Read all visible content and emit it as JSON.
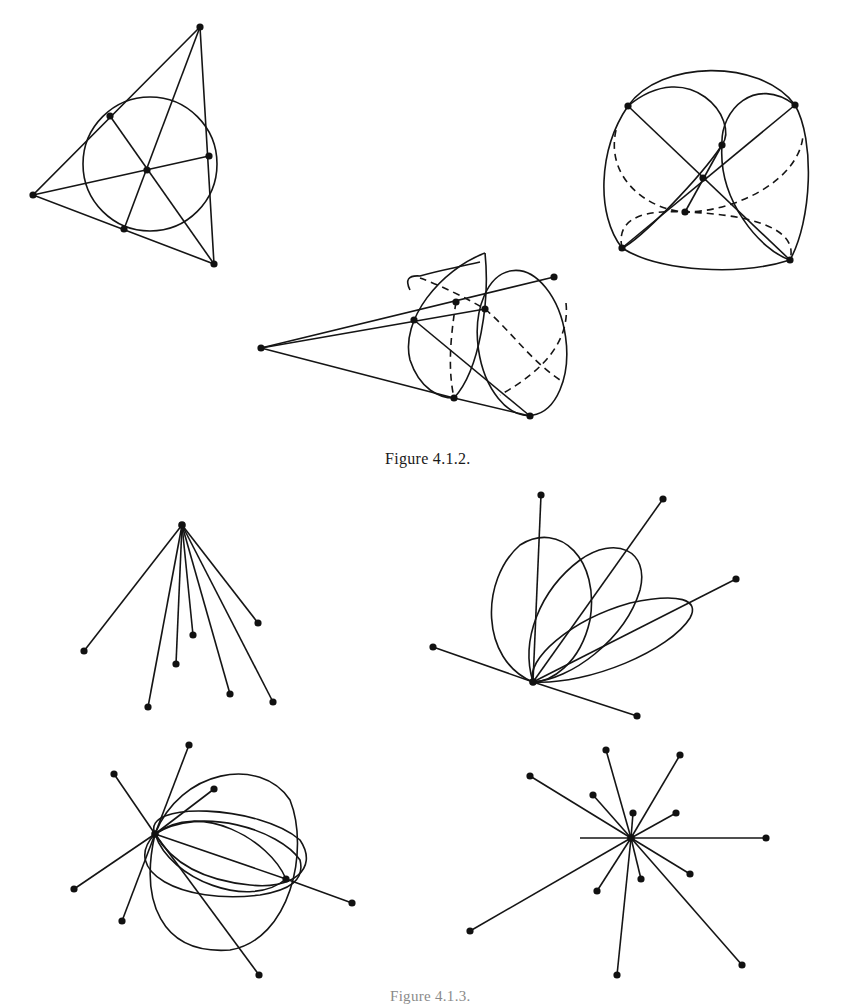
{
  "page": {
    "captions": {
      "figure_4_1_2": "Figure 4.1.2.",
      "figure_bottom_partial": "Figure 4.1.3."
    }
  },
  "figure_4_1_2": {
    "panels": [
      {
        "id": "triangle-incircle",
        "description": "Triangle with inscribed circle, three cevians through center, 7 points"
      },
      {
        "id": "sphere-arcs",
        "description": "Spherical configuration with ellipse arcs, dashed hidden arcs, 7 points"
      },
      {
        "id": "cone-ellipses",
        "description": "Cone-like figure from apex with ellipses and dashed arcs, 7 points"
      }
    ]
  },
  "figure_bottom": {
    "panels": [
      {
        "id": "fan-star",
        "description": "Single center point with 7 spokes to endpoints"
      },
      {
        "id": "petal-ellipses",
        "description": "Point with 5 spokes and 3 ellipse loops"
      },
      {
        "id": "pinched-ellipses",
        "description": "Two centers joined by ellipses with 8 spokes"
      },
      {
        "id": "star-burst",
        "description": "Center with 13 spokes of varying length"
      }
    ]
  }
}
